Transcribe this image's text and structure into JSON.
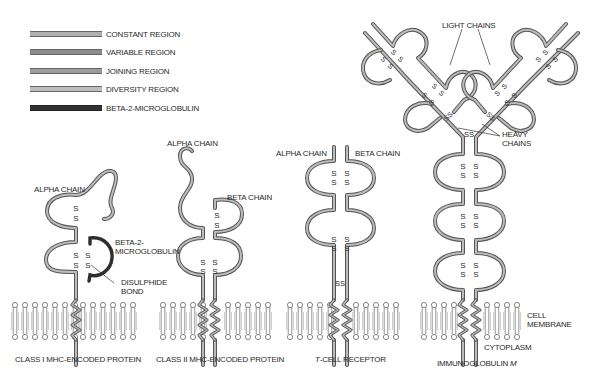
{
  "legend": {
    "items": [
      {
        "label": "CONSTANT REGION",
        "color": "#a8a8a8"
      },
      {
        "label": "VARIABLE REGION",
        "color": "#8a8a8a"
      },
      {
        "label": "JOINING REGION",
        "color": "#9a9a9a"
      },
      {
        "label": "DIVERSITY REGION",
        "color": "#b4b4b4"
      },
      {
        "label": "BETA-2-MICROGLOBULIN",
        "color": "#3a3a3a"
      }
    ]
  },
  "molecules": {
    "class1": {
      "title": "CLASS I MHC-ENCODED PROTEIN",
      "alpha_chain": "ALPHA CHAIN",
      "beta2_line1": "BETA-2-",
      "beta2_line2": "MICROGLOBULIN",
      "disulphide_line1": "DISULPHIDE",
      "disulphide_line2": "BOND"
    },
    "class2": {
      "title": "CLASS II MHC-ENCODED PROTEIN",
      "alpha_chain": "ALPHA CHAIN",
      "beta_chain": "BETA CHAIN"
    },
    "tcr": {
      "title_italic": "T",
      "title_rest": "-CELL RECEPTOR",
      "alpha_chain": "ALPHA CHAIN",
      "beta_chain": "BETA CHAIN",
      "ss": "SS"
    },
    "igm": {
      "title_main": "IMMUNOGLOBULIN ",
      "title_italic": "M",
      "light_chains": "LIGHT CHAINS",
      "heavy_line1": "HEAVY",
      "heavy_line2": "CHAINS",
      "ss": "SS"
    }
  },
  "membrane": {
    "cell_membrane_line1": "CELL",
    "cell_membrane_line2": "MEMBRANE",
    "cytoplasm": "CYTOPLASM"
  },
  "symbols": {
    "sulfur": "S"
  },
  "colors": {
    "chain_outline": "#555555",
    "chain_fill": "#b0b0b0",
    "beta2": "#2e2e2e",
    "lipid": "#777777",
    "text": "#2a2a2a"
  }
}
